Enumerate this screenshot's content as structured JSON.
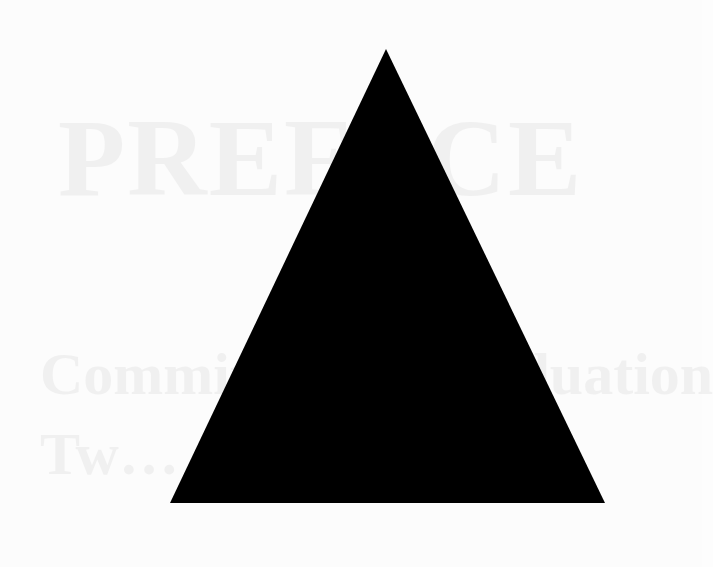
{
  "page": {
    "background_color": "#fcfcfc",
    "bleed_through_text": {
      "title": "PREFACE",
      "line1": "Committee … Graduation",
      "line2": "Tw… 1969"
    }
  },
  "figure": {
    "shape": "triangle",
    "fill_color": "#000000",
    "vertices": {
      "apex": [
        386,
        49
      ],
      "bottom_left": [
        170,
        503
      ],
      "bottom_right": [
        605,
        503
      ]
    }
  }
}
